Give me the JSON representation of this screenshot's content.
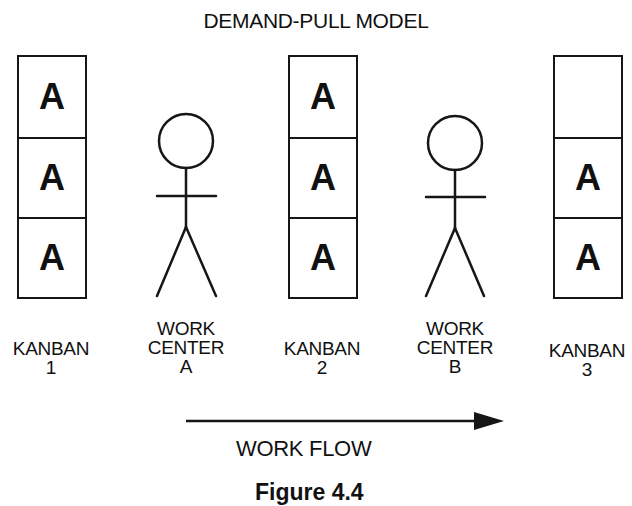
{
  "diagram": {
    "title": "DEMAND-PULL MODEL",
    "kanbans": [
      {
        "id": "kanban-1",
        "label_line1": "KANBAN",
        "label_line2": "1",
        "slots": [
          "A",
          "A",
          "A"
        ]
      },
      {
        "id": "kanban-2",
        "label_line1": "KANBAN",
        "label_line2": "2",
        "slots": [
          "A",
          "A",
          "A"
        ]
      },
      {
        "id": "kanban-3",
        "label_line1": "KANBAN",
        "label_line2": "3",
        "slots": [
          "",
          "A",
          "A"
        ]
      }
    ],
    "work_centers": [
      {
        "id": "work-center-a",
        "label_line1": "WORK",
        "label_line2": "CENTER",
        "label_line3": "A"
      },
      {
        "id": "work-center-b",
        "label_line1": "WORK",
        "label_line2": "CENTER",
        "label_line3": "B"
      }
    ],
    "flow": {
      "label": "WORK FLOW",
      "direction": "left-to-right"
    },
    "caption": "Figure 4.4",
    "colors": {
      "ink": "#161616",
      "background": "#ffffff"
    }
  }
}
